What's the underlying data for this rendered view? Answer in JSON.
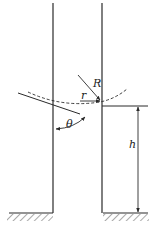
{
  "diagram": {
    "labels": {
      "R": "R",
      "r": "r",
      "theta": "θ",
      "h": "h"
    },
    "colors": {
      "stroke": "#2a2a2a",
      "background": "#ffffff"
    },
    "elements": [
      "capillary-tube-left-wall",
      "capillary-tube-right-wall",
      "meniscus-arc-dashed",
      "contact-angle-tangent-line",
      "radius-R-arrow",
      "radius-r-arrow",
      "contact-angle-theta-arc",
      "height-h-dimension-arrow",
      "ground-surface-left",
      "ground-surface-right"
    ]
  }
}
